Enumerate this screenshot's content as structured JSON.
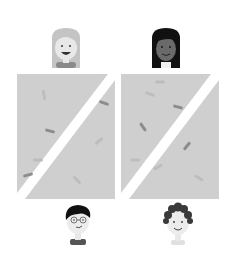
{
  "illustration": {
    "description": "Two slide panels of rod-shaped bacteria with people above and below",
    "colors": {
      "background": "#ffffff",
      "panel": "#cfcfcf",
      "stripe": "#ffffff",
      "bacteria_dark": "#8c8c8c",
      "bacteria_light": "#bdbdbd",
      "skin_light": "#e8e8e8",
      "skin_dark": "#6a6a6a",
      "hair_light": "#c4c4c4",
      "hair_dark": "#111111",
      "hair_curly": "#3a3a3a",
      "shirt": "#6e6e6e"
    },
    "people": [
      {
        "id": "top-left",
        "label": "girl-light-hair"
      },
      {
        "id": "top-right",
        "label": "girl-dark-hair"
      },
      {
        "id": "bottom-left",
        "label": "boy-glasses"
      },
      {
        "id": "bottom-right",
        "label": "boy-curly-hair"
      }
    ],
    "panels": [
      {
        "id": "left",
        "bacteria_count": 7
      },
      {
        "id": "right",
        "bacteria_count": 8
      }
    ]
  }
}
